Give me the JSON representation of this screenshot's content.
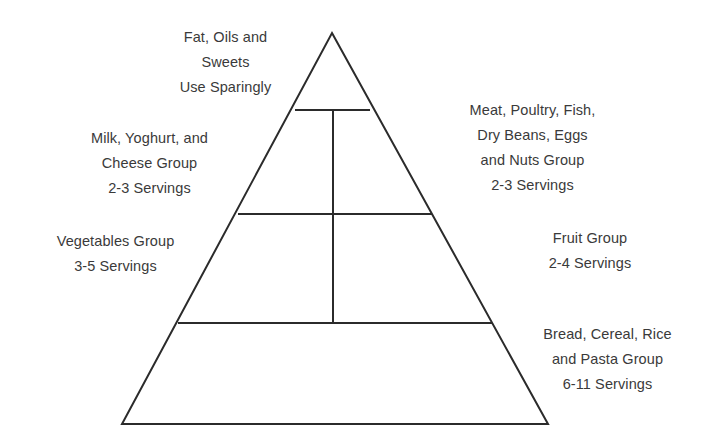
{
  "diagram": {
    "type": "food-guide-pyramid",
    "background_color": "#ffffff",
    "stroke_color": "#2b2b2b",
    "text_color": "#3a3a3a",
    "stroke_width": 2
  },
  "pyramid": {
    "apex": {
      "x": 332,
      "y": 33
    },
    "base_left": {
      "x": 122,
      "y": 424
    },
    "base_right": {
      "x": 548,
      "y": 424
    },
    "dividers": [
      {
        "y": 110,
        "x1": 295,
        "x2": 370
      },
      {
        "y": 214,
        "x1": 238,
        "x2": 432
      },
      {
        "y": 323,
        "x1": 178,
        "x2": 492
      }
    ],
    "center_line": {
      "x": 333,
      "y1": 110,
      "y2": 323
    }
  },
  "labels": {
    "fats": {
      "name": "Fat, Oils and Sweets",
      "lines": [
        "Fat, Oils and",
        "Sweets",
        "Use Sparingly"
      ],
      "servings": "Use Sparingly",
      "tier": 1
    },
    "milk": {
      "name": "Milk, Yoghurt, and Cheese Group",
      "lines": [
        "Milk, Yoghurt, and",
        "Cheese Group",
        "2-3 Servings"
      ],
      "servings": "2-3 Servings",
      "tier": 2
    },
    "meat": {
      "name": "Meat, Poultry, Fish, Dry Beans, Eggs and Nuts Group",
      "lines": [
        "Meat, Poultry, Fish,",
        "Dry Beans, Eggs",
        "and Nuts Group",
        "2-3 Servings"
      ],
      "servings": "2-3 Servings",
      "tier": 2
    },
    "vegetables": {
      "name": "Vegetables Group",
      "lines": [
        "Vegetables Group",
        "3-5 Servings"
      ],
      "servings": "3-5 Servings",
      "tier": 3
    },
    "fruit": {
      "name": "Fruit Group",
      "lines": [
        "Fruit Group",
        "2-4 Servings"
      ],
      "servings": "2-4 Servings",
      "tier": 3
    },
    "bread": {
      "name": "Bread, Cereal, Rice and Pasta Group",
      "lines": [
        "Bread, Cereal, Rice",
        "and Pasta Group",
        "6-11 Servings"
      ],
      "servings": "6-11 Servings",
      "tier": 4
    }
  }
}
